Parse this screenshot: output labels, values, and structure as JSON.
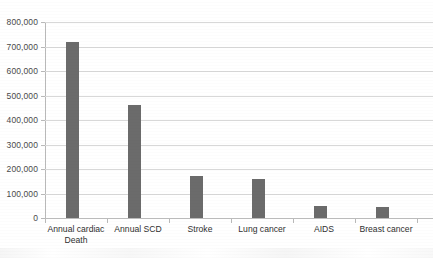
{
  "chart_data": {
    "type": "bar",
    "title": "",
    "subtitle": "",
    "xlabel": "",
    "ylabel": "",
    "categories": [
      "Annual cardiac\nDeath",
      "Annual SCD",
      "Stroke",
      "Lung cancer",
      "AIDS",
      "Breast cancer"
    ],
    "values": [
      720000,
      460000,
      170000,
      160000,
      48000,
      45000
    ],
    "ylim": [
      0,
      800000
    ],
    "ytick_labels": [
      "800,000",
      "700,000",
      "600,000",
      "500,000",
      "400,000",
      "300,000",
      "200,000",
      "100,000",
      "0"
    ],
    "ytick_values": [
      800000,
      700000,
      600000,
      500000,
      400000,
      300000,
      200000,
      100000,
      0
    ],
    "grid": true,
    "legend": false,
    "legend_position": "none",
    "series": [
      {
        "name": "Deaths per year",
        "values": [
          720000,
          460000,
          170000,
          160000,
          48000,
          45000
        ]
      }
    ]
  },
  "style": {
    "bar_color": "#6b6b6b",
    "gridline_color": "#d8d8d8",
    "axis_color": "#b9b9b9",
    "label_color": "#2f2f2f",
    "tick_label_color": "#4a4a4a",
    "background": "#ffffff"
  }
}
